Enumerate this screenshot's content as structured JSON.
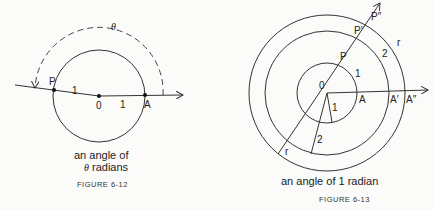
{
  "figure_12": {
    "labels": {
      "P": "P",
      "O": "0",
      "A": "A",
      "r1": "1",
      "r2": "1",
      "theta": "θ"
    },
    "caption_line1": "an angle of",
    "caption_theta": "θ",
    "caption_line2_rest": " radians",
    "figure_label": "FIGURE 6-12"
  },
  "figure_13": {
    "labels": {
      "O": "0",
      "P": "P",
      "P1": "P′",
      "P2": "P″",
      "A": "A",
      "A1": "A′",
      "A2": "A″",
      "arc1": "1",
      "arc2": "2",
      "arc_r": "r",
      "rad1": "1",
      "rad2": "2",
      "rad_r": "r"
    },
    "caption": "an angle of 1 radian",
    "figure_label": "FIGURE 6-13"
  }
}
